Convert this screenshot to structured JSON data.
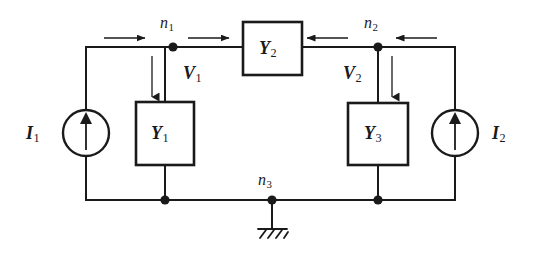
{
  "diagram": {
    "type": "circuit-schematic",
    "canvas": {
      "width": 540,
      "height": 267
    },
    "colors": {
      "wire": "#1a1a1a",
      "background": "#ffffff",
      "text": "#1a1a1a"
    }
  },
  "labels": {
    "node1": {
      "base": "n",
      "sub": "1"
    },
    "node2": {
      "base": "n",
      "sub": "2"
    },
    "node3": {
      "base": "n",
      "sub": "3"
    },
    "voltage1": {
      "base": "V",
      "sub": "1"
    },
    "voltage2": {
      "base": "V",
      "sub": "2"
    },
    "current1": {
      "base": "I",
      "sub": "1"
    },
    "current2": {
      "base": "I",
      "sub": "2"
    },
    "admittance1": {
      "base": "Y",
      "sub": "1"
    },
    "admittance2": {
      "base": "Y",
      "sub": "2"
    },
    "admittance3": {
      "base": "Y",
      "sub": "3"
    }
  },
  "components": [
    {
      "id": "Y1",
      "kind": "admittance-box",
      "label": "Y1",
      "x": 136,
      "y": 102,
      "w": 58,
      "h": 63
    },
    {
      "id": "Y2",
      "kind": "admittance-box",
      "label": "Y2",
      "x": 243,
      "y": 22,
      "w": 59,
      "h": 53
    },
    {
      "id": "Y3",
      "kind": "admittance-box",
      "label": "Y3",
      "x": 348,
      "y": 103,
      "w": 60,
      "h": 62
    },
    {
      "id": "I1",
      "kind": "current-source",
      "label": "I1",
      "cx": 86,
      "cy": 133,
      "r": 23,
      "direction": "up"
    },
    {
      "id": "I2",
      "kind": "current-source",
      "label": "I2",
      "cx": 455,
      "cy": 133,
      "r": 23,
      "direction": "up"
    },
    {
      "id": "GND",
      "kind": "ground-symbol",
      "x": 272,
      "y": 200
    }
  ],
  "nodes": [
    {
      "id": "n1",
      "x": 173,
      "y": 47
    },
    {
      "id": "n2",
      "x": 378,
      "y": 47
    },
    {
      "id": "n3",
      "x": 272,
      "y": 200
    },
    {
      "id": "j1",
      "x": 165,
      "y": 200
    },
    {
      "id": "j3",
      "x": 378,
      "y": 200
    }
  ],
  "current_arrows": [
    {
      "for": "I1",
      "x1": 104,
      "y1": 38,
      "x2": 146,
      "y2": 38,
      "direction": "right"
    },
    {
      "for": "I1",
      "x1": 188,
      "y1": 38,
      "x2": 230,
      "y2": 38,
      "direction": "right"
    },
    {
      "for": "I2",
      "x1": 348,
      "y1": 38,
      "x2": 306,
      "y2": 38,
      "direction": "left"
    },
    {
      "for": "I2",
      "x1": 437,
      "y1": 38,
      "x2": 395,
      "y2": 38,
      "direction": "left"
    }
  ],
  "voltage_arrows": [
    {
      "for": "V1",
      "x": 152,
      "y1": 56,
      "y2": 98,
      "direction": "down"
    },
    {
      "for": "V2",
      "x": 392,
      "y1": 56,
      "y2": 98,
      "direction": "down"
    }
  ]
}
